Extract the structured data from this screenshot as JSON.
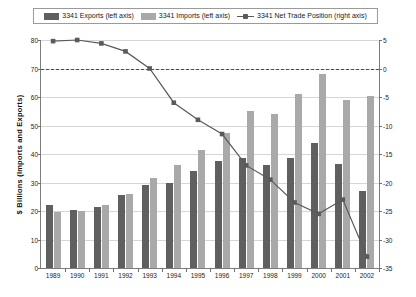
{
  "legend": {
    "entries": [
      {
        "label": "3341 Exports (left axis)",
        "marker": "swatch",
        "color": "#5f5f5f",
        "name": "legend-exports"
      },
      {
        "label": "3341 Imports (left axis)",
        "marker": "swatch",
        "color": "#a9a9a9",
        "name": "legend-imports"
      },
      {
        "label": "3341 Net Trade Position (right axis)",
        "marker": "line",
        "color": "#5a5a5a",
        "name": "legend-net-trade"
      }
    ]
  },
  "axes": {
    "y_left_title": "$ Billions (Imports and Exports)",
    "y_right_title": "$ Billions (Net Trade Position; Positive is a Surplus)",
    "y_left_ticks": [
      "80",
      "70",
      "60",
      "50",
      "40",
      "30",
      "20",
      "10",
      "0"
    ],
    "y_right_ticks": [
      "5",
      "0",
      "-5",
      "-10",
      "-15",
      "-20",
      "-25",
      "-30",
      "-35"
    ]
  },
  "chart_data": {
    "type": "bar",
    "title": "",
    "subtitle": "",
    "xlabel": "",
    "ylabel": "$ Billions (Imports and Exports)",
    "y2label": "$ Billions (Net Trade Position; Positive is a Surplus)",
    "grid": true,
    "legend_position": "top",
    "categories": [
      "1989",
      "1990",
      "1991",
      "1992",
      "1993",
      "1994",
      "1995",
      "1996",
      "1997",
      "1998",
      "1999",
      "2000",
      "2001",
      "2002"
    ],
    "ylim": [
      0,
      80
    ],
    "y2lim": [
      -35,
      5
    ],
    "ytick_step": 10,
    "y2tick_step": 5,
    "zero_reference_line": {
      "value": 0,
      "axis": "right",
      "style": "dashed"
    },
    "series": [
      {
        "name": "3341 Exports (left axis)",
        "axis": "left",
        "type": "bar",
        "color": "#5f5f5f",
        "values": [
          22,
          20.5,
          21.5,
          25.5,
          29,
          30,
          34,
          37.5,
          38.5,
          36,
          38.5,
          44,
          36.5,
          27
        ]
      },
      {
        "name": "3341 Imports (left axis)",
        "axis": "left",
        "type": "bar",
        "color": "#a9a9a9",
        "values": [
          19.5,
          20,
          22,
          26,
          31.5,
          36,
          41.5,
          47.5,
          55,
          54,
          61,
          68,
          59,
          60.5
        ]
      },
      {
        "name": "3341 Net Trade Position (right axis)",
        "axis": "right",
        "type": "line",
        "color": "#5a5a5a",
        "marker": "square",
        "values": [
          4.8,
          5.0,
          4.4,
          3.0,
          0.0,
          -6.0,
          -9.0,
          -11.5,
          -17.0,
          -19.5,
          -23.5,
          -25.5,
          -23.0,
          -33.0
        ]
      }
    ]
  }
}
